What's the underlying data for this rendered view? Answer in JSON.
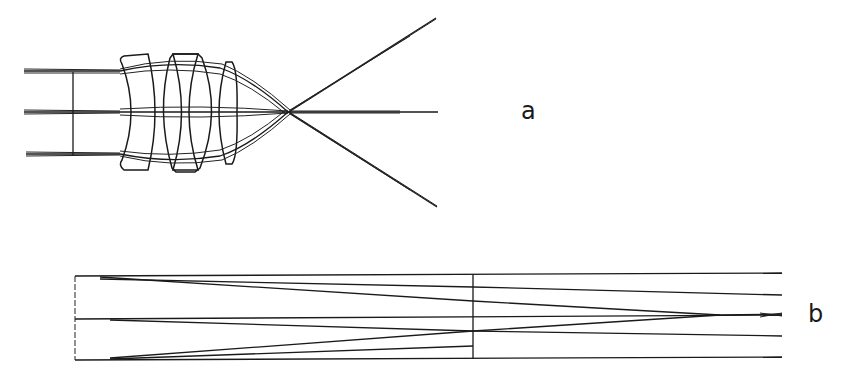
{
  "figure": {
    "panels": [
      {
        "id": "a",
        "label": "a",
        "description": "Lens system ray trace: three parallel input ray bundles pass through three lens elements and converge to a focal point, then diverge"
      },
      {
        "id": "b",
        "label": "b",
        "description": "Unfolded ray diagram in rectangular guide with vertical divider, rays converging toward right"
      }
    ]
  }
}
